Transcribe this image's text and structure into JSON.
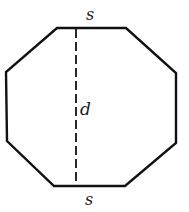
{
  "figure": {
    "shape": "regular-octagon",
    "labels": {
      "top_side": "s",
      "bottom_side": "s",
      "diameter": "d"
    },
    "colors": {
      "stroke": "#111111",
      "background": "#ffffff"
    }
  }
}
